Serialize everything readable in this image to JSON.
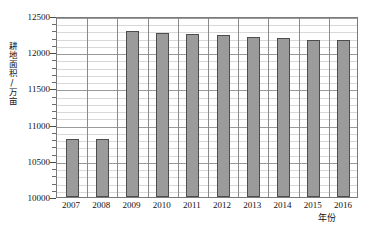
{
  "chart_data": {
    "type": "bar",
    "title": "",
    "xlabel": "年份",
    "ylabel": "耕地面积/万亩",
    "categories": [
      "2007",
      "2008",
      "2009",
      "2010",
      "2011",
      "2012",
      "2013",
      "2014",
      "2015",
      "2016"
    ],
    "values": [
      10800,
      10800,
      12290,
      12265,
      12250,
      12235,
      12215,
      12200,
      12175,
      12170
    ],
    "ylim": [
      10000,
      12500
    ],
    "ytick_labels": [
      "10000",
      "10500",
      "11000",
      "11500",
      "12000",
      "12500"
    ],
    "ytick_values": [
      10000,
      10500,
      11000,
      11500,
      12000,
      12500
    ],
    "y_minor_step": 100,
    "grid": true,
    "legend": "none",
    "bar_color": "#9b9b9b",
    "bar_border_color": "#4d4d4d",
    "gridline_color": "#d8d8d8",
    "axis_color": "#7a7a7a"
  }
}
